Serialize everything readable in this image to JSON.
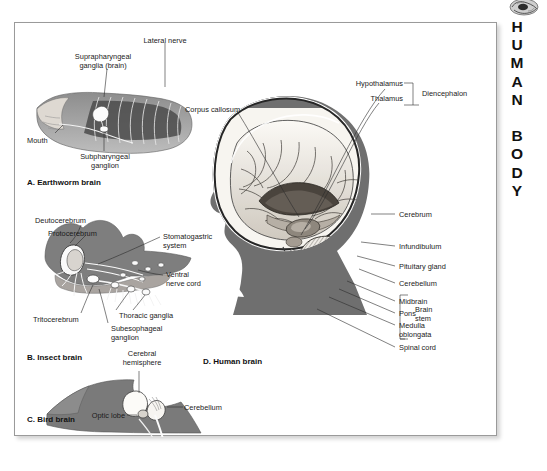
{
  "running_head": "HUMAN BODY",
  "corner_icon": "brain-icon",
  "figures": {
    "earthworm": {
      "caption": "A. Earthworm brain",
      "labels": {
        "lateral_nerve": "Lateral nerve",
        "supra": "Suprapharyngeal\nganglia (brain)",
        "mouth": "Mouth",
        "sub": "Subpharyngeal\nganglion"
      }
    },
    "insect": {
      "caption": "B. Insect brain",
      "labels": {
        "deutocerebrum": "Deutocerebrum",
        "protocerebrum": "Protocerebrum",
        "stomatogastric": "Stomatogastric\nsystem",
        "ventral": "Ventral\nnerve cord",
        "tritocerebrum": "Tritocerebrum",
        "thoracic": "Thoracic ganglia",
        "subesophageal": "Subesophageal\nganglion"
      }
    },
    "bird": {
      "caption": "C. Bird brain",
      "labels": {
        "cerebral_hemisphere": "Cerebral\nhemisphere",
        "cerebellum": "Cerebellum",
        "optic_lobe": "Optic lobe"
      }
    },
    "human": {
      "caption": "D. Human brain",
      "labels": {
        "corpus_callosum": "Corpus callosum",
        "hypothalamus": "Hypothalamus",
        "thalamus": "Thalamus",
        "diencephalon": "Diencephalon",
        "cerebrum": "Cerebrum",
        "infundibulum": "Infundibulum",
        "pituitary_gland": "Pituitary gland",
        "cerebellum": "Cerebellum",
        "midbrain": "Midbrain",
        "pons": "Pons",
        "medulla": "Medulla\noblongata",
        "brain_stem": "Brain\nstem",
        "spinal_cord": "Spinal cord"
      }
    }
  },
  "colors": {
    "silhouette": "#6f6f6f",
    "skull_dark": "#2e2e2e",
    "tissue_light": "#f2efe9",
    "tissue_mid": "#b9b4ac",
    "tissue_dark": "#555049",
    "frame": "#9a9a9a",
    "text": "#1b1b1b"
  }
}
